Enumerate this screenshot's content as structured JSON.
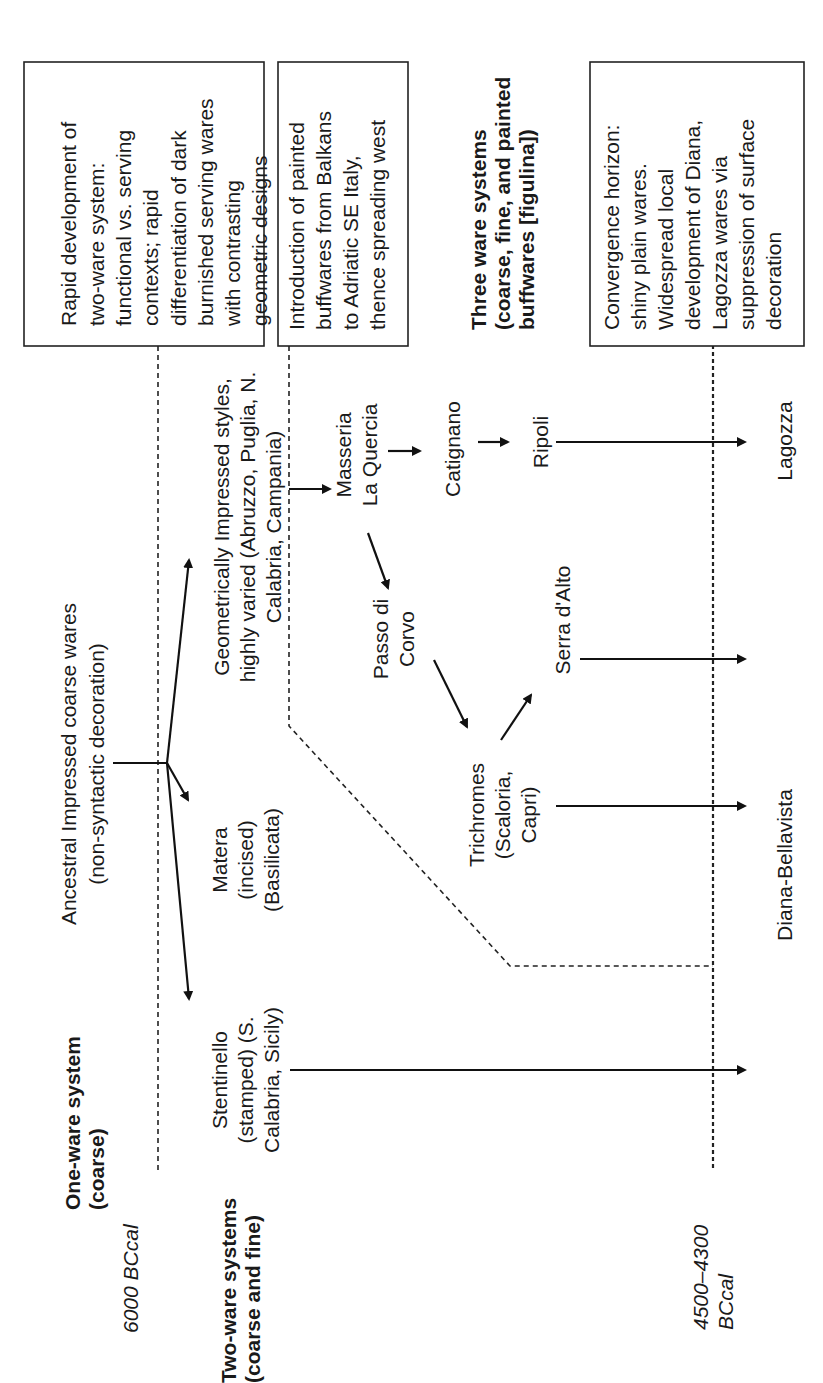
{
  "diagram": {
    "orientation": "rotated 90 degrees counter-clockwise",
    "time_markers": {
      "start": "6000 BCcal",
      "end_line1": "4500–4300",
      "end_line2": "BCcal"
    },
    "system_labels": {
      "one_ware": [
        "One-ware system",
        "(coarse)"
      ],
      "two_ware": [
        "Two-ware systems",
        "(coarse and fine)"
      ],
      "three_ware": [
        "Three ware  systems",
        "(coarse, fine, and painted",
        "buffwares [figulina])"
      ]
    },
    "boxes": {
      "box1": [
        "Rapid development of",
        "two-ware system:",
        "functional vs. serving",
        "contexts; rapid",
        "differentiation of dark",
        "burnished serving wares",
        "with contrasting",
        "geometric designs"
      ],
      "box2": [
        "Introduction of painted",
        "buffwares from Balkans",
        "to Adriatic SE Italy,",
        "thence spreading west"
      ],
      "box3": [
        "Convergence horizon:",
        "shiny plain wares.",
        "Widespread local",
        "development of Diana,",
        "Lagozza wares via",
        "suppression of surface",
        "decoration"
      ]
    },
    "nodes": {
      "ancestral": [
        "Ancestral Impressed coarse wares",
        "(non-syntactic decoration)"
      ],
      "stentinello": [
        "Stentinello",
        "(stamped) (S.",
        "Calabria, Sicily)"
      ],
      "matera": [
        "Matera",
        "(incised)",
        "(Basilicata)"
      ],
      "geometric": [
        "Geometrically Impressed styles,",
        "highly varied (Abruzzo, Puglia, N.",
        "Calabria, Campania)"
      ],
      "masseria": [
        "Masseria",
        "La Quercia"
      ],
      "catignano": [
        "Catignano"
      ],
      "ripoli": [
        "Ripoli"
      ],
      "passo": [
        "Passo di",
        "Corvo"
      ],
      "serra": [
        "Serra d'Alto"
      ],
      "trichromes": [
        "Trichromes",
        "(Scaloria,",
        "Capri)"
      ],
      "lagozza": [
        "Lagozza"
      ],
      "diana": [
        "Diana-Bellavista"
      ]
    },
    "colors": {
      "ink": "#1a1a1a",
      "background": "#ffffff"
    }
  }
}
